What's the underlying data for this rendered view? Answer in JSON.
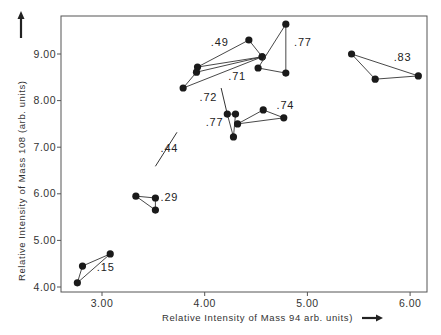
{
  "chart_data": {
    "type": "scatter",
    "title": "",
    "xlabel": "Relative Intensity of Mass 94 arb. units)",
    "ylabel": "Relative Intensity of Mass 108 (arb. units)",
    "xlim": [
      2.6,
      6.2
    ],
    "ylim": [
      3.9,
      9.8
    ],
    "grid": false,
    "legend": null,
    "x_ticks": [
      {
        "value": 3.0,
        "label": "3.00"
      },
      {
        "value": 4.0,
        "label": "4.00"
      },
      {
        "value": 5.0,
        "label": "5.00"
      },
      {
        "value": 6.0,
        "label": "6.00"
      }
    ],
    "y_ticks": [
      {
        "value": 4.0,
        "label": "4.00"
      },
      {
        "value": 5.0,
        "label": "5.00"
      },
      {
        "value": 6.0,
        "label": "6.00"
      },
      {
        "value": 7.0,
        "label": "7.00"
      },
      {
        "value": 8.0,
        "label": "8.00"
      },
      {
        "value": 9.0,
        "label": "9.00"
      }
    ],
    "groups": [
      {
        "label": ".15",
        "kind": "triangle",
        "points": [
          [
            3.08,
            4.71
          ],
          [
            2.81,
            4.45
          ],
          [
            2.76,
            4.09
          ]
        ],
        "label_pos": [
          2.95,
          4.35
        ]
      },
      {
        "label": ".29",
        "kind": "triangle",
        "points": [
          [
            3.33,
            5.95
          ],
          [
            3.52,
            5.91
          ],
          [
            3.52,
            5.65
          ]
        ],
        "label_pos": [
          3.57,
          5.85
        ]
      },
      {
        "label": ".44",
        "kind": "line",
        "points": [
          [
            3.52,
            6.59
          ],
          [
            3.73,
            7.32
          ]
        ],
        "label_pos": [
          3.57,
          6.9
        ]
      },
      {
        "label": ".49",
        "kind": "triangle",
        "points": [
          [
            3.93,
            8.72
          ],
          [
            4.43,
            9.3
          ],
          [
            4.56,
            8.94
          ]
        ],
        "label_pos": [
          4.06,
          9.18
        ]
      },
      {
        "label": ".71",
        "kind": "triangle",
        "points": [
          [
            3.79,
            8.27
          ],
          [
            3.92,
            8.61
          ],
          [
            4.56,
            8.94
          ]
        ],
        "label_pos": [
          4.23,
          8.45
        ]
      },
      {
        "label": ".77",
        "kind": "triangle",
        "points": [
          [
            4.79,
            9.64
          ],
          [
            4.52,
            8.7
          ],
          [
            4.79,
            8.59
          ]
        ],
        "label_pos": [
          4.87,
          9.18
        ]
      },
      {
        "label": ".72",
        "kind": "line",
        "points": [
          [
            4.16,
            8.27
          ],
          [
            4.22,
            7.71
          ]
        ],
        "label_pos": [
          3.95,
          8.0
        ]
      },
      {
        "label": ".77",
        "kind": "triangle",
        "points": [
          [
            4.22,
            7.71
          ],
          [
            4.28,
            7.22
          ],
          [
            4.3,
            7.71
          ]
        ],
        "label_pos": [
          4.01,
          7.45
        ]
      },
      {
        "label": ".74",
        "kind": "triangle",
        "points": [
          [
            4.32,
            7.5
          ],
          [
            4.57,
            7.8
          ],
          [
            4.77,
            7.63
          ]
        ],
        "label_pos": [
          4.7,
          7.82
        ]
      },
      {
        "label": ".83",
        "kind": "triangle",
        "points": [
          [
            5.43,
            9.0
          ],
          [
            5.66,
            8.46
          ],
          [
            6.08,
            8.53
          ]
        ],
        "label_pos": [
          5.84,
          8.86
        ]
      }
    ],
    "axis_arrows": {
      "x": "right",
      "y": "up"
    }
  }
}
